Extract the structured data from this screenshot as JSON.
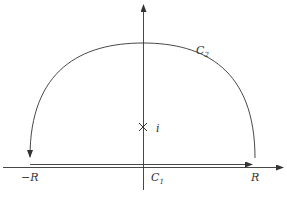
{
  "diagram": {
    "title": "",
    "labels": {
      "upper_arc": "C",
      "upper_arc_sub": "2",
      "segment": "C",
      "segment_sub": "1",
      "left_end": "−R",
      "right_end": "R",
      "pole": "i"
    },
    "elements": {
      "real_axis": {
        "from": [
          3,
          167
        ],
        "to": [
          283,
          167
        ],
        "arrow": "right"
      },
      "imaginary_axis": {
        "from": [
          143,
          190
        ],
        "to": [
          143,
          5
        ],
        "arrow": "up"
      },
      "segment_c1": {
        "from": [
          30,
          164
        ],
        "to": [
          255,
          164
        ],
        "arrow": "right",
        "label": "C1"
      },
      "arc_c2": {
        "from": [
          255,
          158
        ],
        "to": [
          30,
          157
        ],
        "apex": [
          143,
          43
        ],
        "arrow": "end",
        "label": "C2"
      },
      "pole_marker": {
        "at": [
          143,
          127
        ],
        "symbol": "×",
        "label": "i"
      }
    },
    "colors": {
      "stroke": "#333333",
      "background": "#ffffff"
    }
  }
}
